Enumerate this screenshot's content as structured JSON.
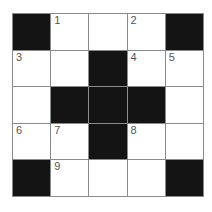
{
  "crossword": {
    "rows": 5,
    "cols": 5,
    "colors": {
      "black": "#141414",
      "white": "#ffffff",
      "line": "#8a8a8a",
      "number": "#555555"
    },
    "cells": [
      [
        {
          "type": "black",
          "num": ""
        },
        {
          "type": "white",
          "num": "1"
        },
        {
          "type": "white",
          "num": ""
        },
        {
          "type": "white",
          "num": "2"
        },
        {
          "type": "black",
          "num": ""
        }
      ],
      [
        {
          "type": "white",
          "num": "3"
        },
        {
          "type": "white",
          "num": ""
        },
        {
          "type": "black",
          "num": ""
        },
        {
          "type": "white",
          "num": "4"
        },
        {
          "type": "white",
          "num": "5"
        }
      ],
      [
        {
          "type": "white",
          "num": ""
        },
        {
          "type": "black",
          "num": ""
        },
        {
          "type": "black",
          "num": ""
        },
        {
          "type": "black",
          "num": ""
        },
        {
          "type": "white",
          "num": ""
        }
      ],
      [
        {
          "type": "white",
          "num": "6"
        },
        {
          "type": "white",
          "num": "7"
        },
        {
          "type": "black",
          "num": ""
        },
        {
          "type": "white",
          "num": "8"
        },
        {
          "type": "white",
          "num": ""
        }
      ],
      [
        {
          "type": "black",
          "num": ""
        },
        {
          "type": "white",
          "num": "9"
        },
        {
          "type": "white",
          "num": ""
        },
        {
          "type": "white",
          "num": ""
        },
        {
          "type": "black",
          "num": ""
        }
      ]
    ]
  }
}
